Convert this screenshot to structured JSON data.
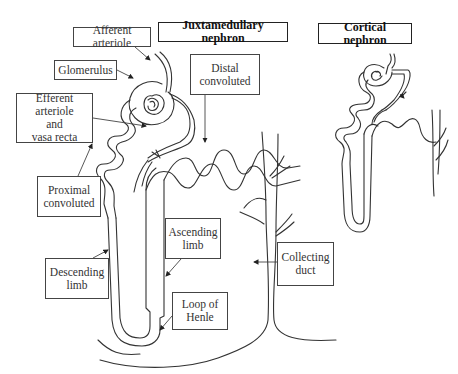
{
  "diagram": {
    "titles": {
      "juxtamedullary": "Juxtamedullary nephron",
      "cortical": "Cortical nephron"
    },
    "labels": {
      "afferent_arteriole": "Afferent arteriole",
      "glomerulus": "Glomerulus",
      "efferent_arteriole_line1": "Efferent arteriole",
      "efferent_arteriole_line2": "and",
      "efferent_arteriole_line3": "vasa recta",
      "proximal_line1": "Proximal",
      "proximal_line2": "convoluted",
      "descending_line1": "Descending",
      "descending_line2": "limb",
      "ascending_line1": "Ascending",
      "ascending_line2": "limb",
      "loop_line1": "Loop of",
      "loop_line2": "Henle",
      "distal_line1": "Distal",
      "distal_line2": "convoluted",
      "collecting_line1": "Collecting",
      "collecting_line2": "duct"
    },
    "colors": {
      "line": "#333333",
      "background": "#ffffff"
    }
  }
}
